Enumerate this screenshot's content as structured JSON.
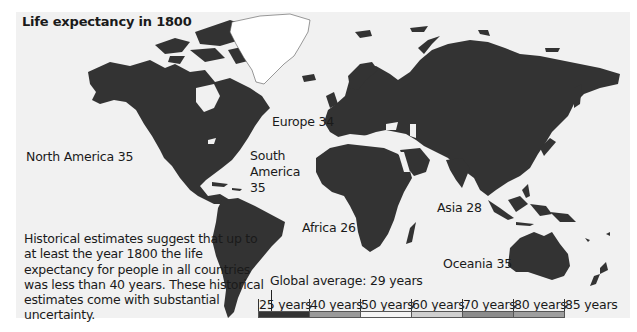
{
  "title": "Life expectancy in 1800",
  "regions": [
    {
      "name": "North America",
      "value": 35,
      "label": "North America 35"
    },
    {
      "name": "Europe",
      "value": 34,
      "label": "Europe 34"
    },
    {
      "name": "South America",
      "value": 35,
      "label_lines": [
        "South",
        "America",
        "35"
      ]
    },
    {
      "name": "Africa",
      "value": 26,
      "label": "Africa 26"
    },
    {
      "name": "Asia",
      "value": 28,
      "label": "Asia 28"
    },
    {
      "name": "Oceania",
      "value": 35,
      "label": "Oceania 35"
    }
  ],
  "note": "Historical estimates suggest that up to at least the year 1800 the life expectancy for people in all countries was less than 40 years. These historical estimates come with substantial uncertainty.",
  "legend": {
    "global_average_label": "Global average: 29 years",
    "global_average_value": 29,
    "ticks": [
      "25 years",
      "40 years",
      "50 years",
      "60 years",
      "70 years",
      "80 years",
      "85 years"
    ],
    "segments": [
      {
        "range": "25-40",
        "color": "#333333"
      },
      {
        "range": "40-50",
        "color": "#9a9a9a"
      },
      {
        "range": "50-60",
        "color": "#f4f4f4"
      },
      {
        "range": "60-70",
        "color": "#cfcfcf"
      },
      {
        "range": "70-80",
        "color": "#8c8c8c"
      },
      {
        "range": "80-85",
        "color": "#9e9e9e"
      }
    ]
  },
  "colors": {
    "land": "#333333",
    "no_data": "#ffffff",
    "background": "#f1f1f1"
  }
}
